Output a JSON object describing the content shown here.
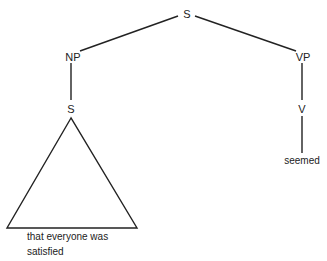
{
  "diagram": {
    "type": "syntax-tree",
    "nodes": {
      "root": {
        "label": "S"
      },
      "np": {
        "label": "NP"
      },
      "embedded_s": {
        "label": "S"
      },
      "vp": {
        "label": "VP"
      },
      "v": {
        "label": "V"
      }
    },
    "leaves": {
      "triangle_text_line1": "that everyone was",
      "triangle_text_line2": "satisfied",
      "verb": "seemed"
    },
    "edges": [
      {
        "from": "S",
        "to": "NP"
      },
      {
        "from": "S",
        "to": "VP"
      },
      {
        "from": "NP",
        "to": "S"
      },
      {
        "from": "S",
        "to": "that everyone was satisfied",
        "style": "triangle"
      },
      {
        "from": "VP",
        "to": "V"
      },
      {
        "from": "V",
        "to": "seemed"
      }
    ],
    "line_color": "#222222"
  }
}
